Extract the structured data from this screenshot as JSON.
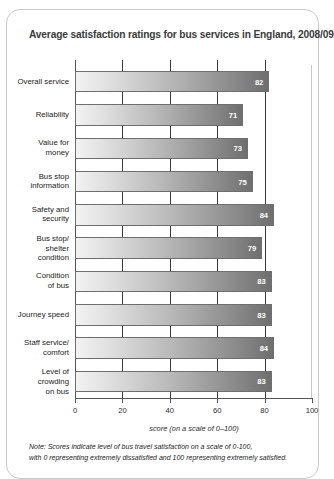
{
  "title": "Average satisfaction ratings for bus services in England, 2008/09",
  "footnote_lines": [
    "Note: Scores indicate level of bus travel satisfaction on a scale of 0-100,",
    "with 0 representing extremely dissatisfied and 100 representing extremely satisfied."
  ],
  "chart_data": {
    "type": "bar",
    "orientation": "horizontal",
    "title": "Average satisfaction ratings for bus services in England, 2008/09",
    "xlabel": "score (on a scale of 0–100)",
    "ylabel": "",
    "xlim": [
      0,
      100
    ],
    "xticks": [
      0,
      20,
      40,
      60,
      80,
      100
    ],
    "xticklabels": [
      "0",
      "20",
      "40",
      "60",
      "80",
      "100"
    ],
    "grid": true,
    "legend": false,
    "categories": [
      "Overall service",
      "Reliability",
      "Value for\nmoney",
      "Bus stop\ninformation",
      "Safety and\nsecurity",
      "Bus stop/\nshelter\ncondition",
      "Condition\nof bus",
      "Journey speed",
      "Staff service/\ncomfort",
      "Level of\ncrowding\non bus"
    ],
    "values": [
      82,
      71,
      73,
      75,
      84,
      79,
      83,
      83,
      84,
      83
    ],
    "value_labels": [
      "82",
      "71",
      "73",
      "75",
      "84",
      "79",
      "83",
      "83",
      "84",
      "83"
    ],
    "note": "Note: Scores indicate level of bus travel satisfaction on a scale of 0-100, with 0 representing extremely dissatisfied and 100 representing extremely satisfied."
  },
  "colors": {
    "bar_gradient_start": "#f2f2f2",
    "bar_gradient_end": "#6f6f6f",
    "bar_border": "#6e6e6e",
    "value_label": "#ffffff",
    "panel_border": "#c9c9c9",
    "title": "#3a3a3a",
    "axis": "#555555"
  }
}
